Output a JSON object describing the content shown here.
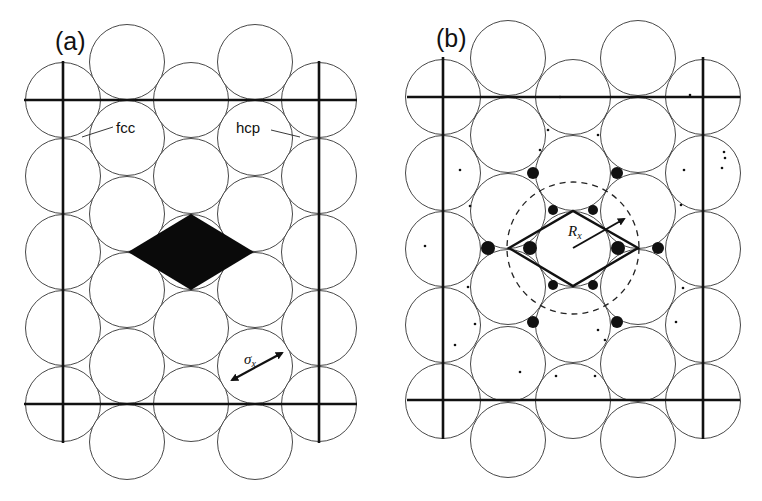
{
  "figure": {
    "panels": [
      {
        "id": "a",
        "label": "(a)",
        "site_labels": {
          "fcc": "fcc",
          "hcp": "hcp"
        },
        "arrow_label": {
          "symbol": "σ",
          "subscript": "x"
        },
        "shaded_region": "rhombus"
      },
      {
        "id": "b",
        "label": "(b)",
        "arrow_label": {
          "symbol": "R",
          "subscript": "x"
        },
        "dashed_circle": true
      }
    ],
    "colors": {
      "background": "#ffffff",
      "ink": "#111111",
      "atom_stroke": "#333333"
    }
  }
}
